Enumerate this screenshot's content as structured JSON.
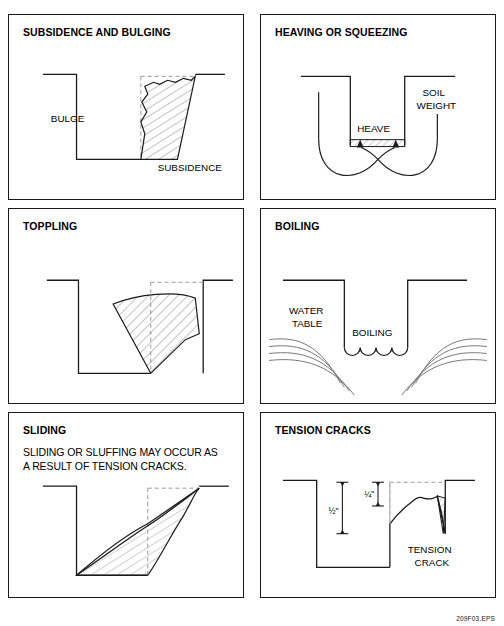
{
  "figure": {
    "id_label": "209F03.EPS",
    "line_color": "#1a1a1a",
    "hatch_color": "#555555",
    "background": "#ffffff"
  },
  "panels": [
    {
      "key": "subsidence",
      "title": "SUBSIDENCE AND BULGING",
      "body": [],
      "labels": {
        "bulge": "BULGE",
        "subsidence": "SUBSIDENCE"
      }
    },
    {
      "key": "heaving",
      "title": "HEAVING OR SQUEEZING",
      "body": [],
      "labels": {
        "heave": "HEAVE",
        "soil": "SOIL",
        "weight": "WEIGHT"
      }
    },
    {
      "key": "toppling",
      "title": "TOPPLING",
      "body": [],
      "labels": {}
    },
    {
      "key": "boiling",
      "title": "BOILING",
      "body": [],
      "labels": {
        "water": "WATER",
        "table": "TABLE",
        "boiling": "BOILING"
      }
    },
    {
      "key": "sliding",
      "title": "SLIDING",
      "body": [
        "SLIDING OR SLUFFING MAY OCCUR AS",
        "A RESULT OF TENSION CRACKS."
      ],
      "labels": {}
    },
    {
      "key": "tension",
      "title": "TENSION CRACKS",
      "body": [],
      "labels": {
        "dim_quarter": "¼\"",
        "dim_half": "½\"",
        "tension": "TENSION",
        "crack": "CRACK"
      }
    }
  ]
}
